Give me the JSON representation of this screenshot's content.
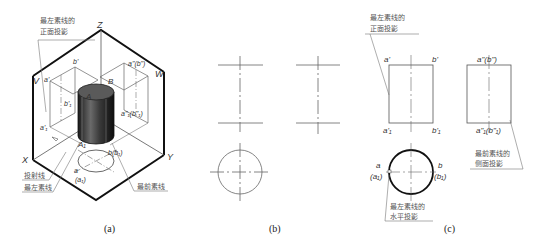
{
  "panels": {
    "a": {
      "caption": "(a)",
      "axes": {
        "z": "Z",
        "x": "X",
        "y": "Y",
        "v": "V",
        "w": "W"
      },
      "points": {
        "a_prime": "a'",
        "b_prime": "b'",
        "a_dblprime_b": "a\"(b\")",
        "b1_prime": "b'₁",
        "a1_prime": "a'₁",
        "a1_dbl_b1": "a\"₁(b\"₁)",
        "A": "A",
        "B": "B",
        "A1": "A₁",
        "b_b1": "b(b₁)",
        "a": "a",
        "a1_paren": "(a₁)"
      },
      "annotations": {
        "leftmost_front": [
          "最左素线的",
          "正面投影"
        ],
        "projection_line": "投射线",
        "leftmost_line": "最左素线",
        "frontmost_line": "最前素线"
      }
    },
    "b": {
      "caption": "(b)"
    },
    "c": {
      "caption": "(c)",
      "points": {
        "a_prime": "a'",
        "b_prime": "b'",
        "a1_prime": "a'₁",
        "b1_prime": "b'₁",
        "a_dbl_b_dbl": "a\"(b\")",
        "a1_dbl_b1_dbl": "a\"₁(b\"₁)",
        "a": "a",
        "a1": "(a₁)",
        "b": "b",
        "b1": "(b₁)"
      },
      "annotations": {
        "leftmost_front": [
          "最左素线的",
          "正面投影"
        ],
        "frontmost_side": [
          "最前素线的",
          "侧面投影"
        ],
        "leftmost_horizontal": [
          "最左素线的",
          "水平投影"
        ]
      }
    }
  },
  "colors": {
    "line": "#555555",
    "frame": "#111111",
    "cylinder_dark": "#2a2a2a",
    "cylinder_top": "#5a5a5a"
  }
}
